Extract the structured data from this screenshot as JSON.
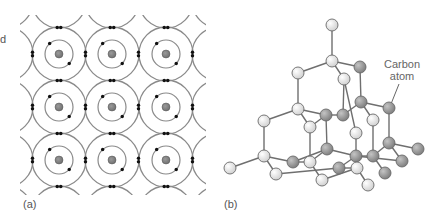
{
  "figure": {
    "panel_a": {
      "label": "(a)",
      "cut_text": "d",
      "description": "Covalent bonding lattice of carbon atoms with shared electron pairs",
      "grid": {
        "cols_x": [
          59,
          112,
          166
        ],
        "rows_y": [
          54,
          107,
          160
        ]
      },
      "nucleus_radius": 4,
      "inner_orbit_radius": 14,
      "outer_orbit_radius": 27,
      "colors": {
        "orbit": "#8a8a8a",
        "nucleus": "#7a7a7a",
        "electron": "#111111"
      }
    },
    "panel_b": {
      "label": "(b)",
      "callout": {
        "line1": "Carbon",
        "line2": "atom"
      },
      "description": "Diamond tetrahedral lattice of carbon atoms",
      "colors": {
        "bond": "#6f6f6f",
        "light_atom": "#eeeeee",
        "dark_atom": "#9a9a9a",
        "atom_stroke": "#6a6a6a",
        "callout": "#666666"
      },
      "atom_radius": 6,
      "atoms": [
        {
          "id": "a1",
          "x": 332,
          "y": 25,
          "t": "L"
        },
        {
          "id": "a2",
          "x": 332,
          "y": 61,
          "t": "L"
        },
        {
          "id": "a3",
          "x": 298,
          "y": 73,
          "t": "L"
        },
        {
          "id": "a4",
          "x": 360,
          "y": 67,
          "t": "D"
        },
        {
          "id": "a5",
          "x": 344,
          "y": 79,
          "t": "L"
        },
        {
          "id": "a6",
          "x": 298,
          "y": 109,
          "t": "L"
        },
        {
          "id": "a7",
          "x": 264,
          "y": 121,
          "t": "L"
        },
        {
          "id": "a8",
          "x": 310,
          "y": 127,
          "t": "L"
        },
        {
          "id": "a9",
          "x": 326,
          "y": 115,
          "t": "D"
        },
        {
          "id": "a10",
          "x": 343,
          "y": 115,
          "t": "D"
        },
        {
          "id": "a11",
          "x": 361,
          "y": 102,
          "t": "D"
        },
        {
          "id": "a12",
          "x": 389,
          "y": 108,
          "t": "D"
        },
        {
          "id": "a13",
          "x": 373,
          "y": 120,
          "t": "L"
        },
        {
          "id": "a14",
          "x": 356,
          "y": 133,
          "t": "L"
        },
        {
          "id": "a15",
          "x": 264,
          "y": 156,
          "t": "L"
        },
        {
          "id": "a16",
          "x": 230,
          "y": 168,
          "t": "L"
        },
        {
          "id": "a17",
          "x": 276,
          "y": 174,
          "t": "L"
        },
        {
          "id": "a18",
          "x": 293,
          "y": 162,
          "t": "D"
        },
        {
          "id": "a19",
          "x": 310,
          "y": 162,
          "t": "L"
        },
        {
          "id": "a20",
          "x": 327,
          "y": 149,
          "t": "D"
        },
        {
          "id": "a21",
          "x": 322,
          "y": 180,
          "t": "L"
        },
        {
          "id": "a22",
          "x": 339,
          "y": 168,
          "t": "D"
        },
        {
          "id": "a23",
          "x": 356,
          "y": 156,
          "t": "D"
        },
        {
          "id": "a24",
          "x": 373,
          "y": 156,
          "t": "D"
        },
        {
          "id": "a25",
          "x": 357,
          "y": 168,
          "t": "L"
        },
        {
          "id": "a26",
          "x": 389,
          "y": 143,
          "t": "D"
        },
        {
          "id": "a27",
          "x": 418,
          "y": 149,
          "t": "D"
        },
        {
          "id": "a28",
          "x": 402,
          "y": 161,
          "t": "D"
        },
        {
          "id": "a29",
          "x": 385,
          "y": 173,
          "t": "D"
        },
        {
          "id": "a30",
          "x": 368,
          "y": 185,
          "t": "L"
        }
      ],
      "bonds": [
        [
          "a1",
          "a2"
        ],
        [
          "a2",
          "a3"
        ],
        [
          "a2",
          "a4"
        ],
        [
          "a2",
          "a5"
        ],
        [
          "a3",
          "a6"
        ],
        [
          "a4",
          "a11"
        ],
        [
          "a5",
          "a14"
        ],
        [
          "a6",
          "a7"
        ],
        [
          "a6",
          "a8"
        ],
        [
          "a6",
          "a9"
        ],
        [
          "a9",
          "a10"
        ],
        [
          "a10",
          "a11"
        ],
        [
          "a11",
          "a12"
        ],
        [
          "a11",
          "a13"
        ],
        [
          "a9",
          "a20"
        ],
        [
          "a10",
          "a5"
        ],
        [
          "a13",
          "a24"
        ],
        [
          "a12",
          "a26"
        ],
        [
          "a7",
          "a15"
        ],
        [
          "a8",
          "a19"
        ],
        [
          "a15",
          "a16"
        ],
        [
          "a15",
          "a17"
        ],
        [
          "a15",
          "a18"
        ],
        [
          "a18",
          "a20"
        ],
        [
          "a19",
          "a21"
        ],
        [
          "a19",
          "a20"
        ],
        [
          "a17",
          "a22"
        ],
        [
          "a18",
          "a19"
        ],
        [
          "a20",
          "a23"
        ],
        [
          "a14",
          "a23"
        ],
        [
          "a22",
          "a23"
        ],
        [
          "a22",
          "a25"
        ],
        [
          "a21",
          "a25"
        ],
        [
          "a23",
          "a24"
        ],
        [
          "a24",
          "a26"
        ],
        [
          "a24",
          "a29"
        ],
        [
          "a23",
          "a28"
        ],
        [
          "a26",
          "a27"
        ],
        [
          "a26",
          "a28"
        ],
        [
          "a25",
          "a30"
        ],
        [
          "a8",
          "a9"
        ]
      ],
      "callout_line": {
        "x1": 399,
        "y1": 84,
        "x2": 391,
        "y2": 104
      }
    }
  }
}
